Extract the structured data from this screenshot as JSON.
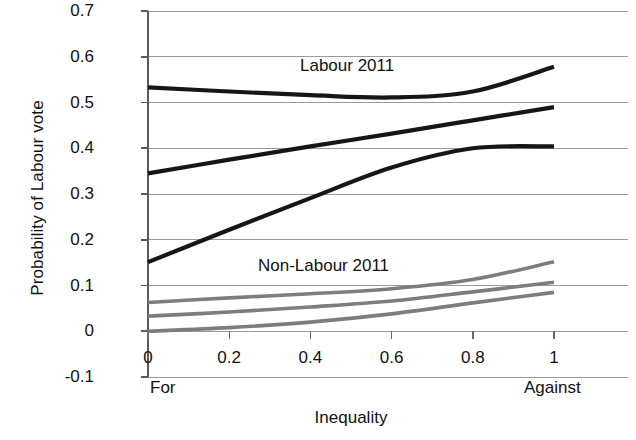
{
  "chart_data": {
    "type": "line",
    "title": "",
    "xlabel": "Inequality",
    "ylabel": "Probability of Labour vote",
    "xlim": [
      0,
      1
    ],
    "ylim": [
      -0.1,
      0.7
    ],
    "grid": true,
    "legend_position": "inline-annotation",
    "x_tick_labels": [
      "0",
      "0.2",
      "0.4",
      "0.6",
      "0.8",
      "1"
    ],
    "x_tick_values": [
      0,
      0.2,
      0.4,
      0.6,
      0.8,
      1
    ],
    "y_tick_labels": [
      "0.7",
      "0.6",
      "0.5",
      "0.4",
      "0.3",
      "0.2",
      "0.1",
      "0",
      "-0.1"
    ],
    "y_tick_values": [
      0.7,
      0.6,
      0.5,
      0.4,
      0.3,
      0.2,
      0.1,
      0,
      -0.1
    ],
    "x_axis_end_labels": {
      "left": "For",
      "right": "Against"
    },
    "annotations": [
      {
        "text": "Labour 2011",
        "x": 0.43,
        "y": 0.59
      },
      {
        "text": "Non-Labour 2011",
        "x": 0.3,
        "y": 0.155
      }
    ],
    "group_colors": {
      "labour": "#161616",
      "non_labour": "#7d7d7d"
    },
    "x": [
      0,
      0.2,
      0.4,
      0.6,
      0.8,
      1
    ],
    "series": [
      {
        "name": "Labour 2011 — upper",
        "group": "labour",
        "color": "#161616",
        "values": [
          0.533,
          0.524,
          0.516,
          0.511,
          0.524,
          0.578
        ]
      },
      {
        "name": "Labour 2011 — middle",
        "group": "labour",
        "color": "#161616",
        "values": [
          0.345,
          0.375,
          0.404,
          0.432,
          0.461,
          0.49
        ]
      },
      {
        "name": "Labour 2011 — lower",
        "group": "labour",
        "color": "#161616",
        "values": [
          0.151,
          0.222,
          0.291,
          0.358,
          0.4,
          0.404
        ]
      },
      {
        "name": "Non-Labour 2011 — upper",
        "group": "non_labour",
        "color": "#7d7d7d",
        "values": [
          0.063,
          0.073,
          0.082,
          0.093,
          0.113,
          0.152
        ]
      },
      {
        "name": "Non-Labour 2011 — middle",
        "group": "non_labour",
        "color": "#7d7d7d",
        "values": [
          0.033,
          0.042,
          0.053,
          0.066,
          0.086,
          0.107
        ]
      },
      {
        "name": "Non-Labour 2011 — lower",
        "group": "non_labour",
        "color": "#7d7d7d",
        "values": [
          0.0,
          0.008,
          0.02,
          0.038,
          0.062,
          0.085
        ]
      }
    ]
  }
}
